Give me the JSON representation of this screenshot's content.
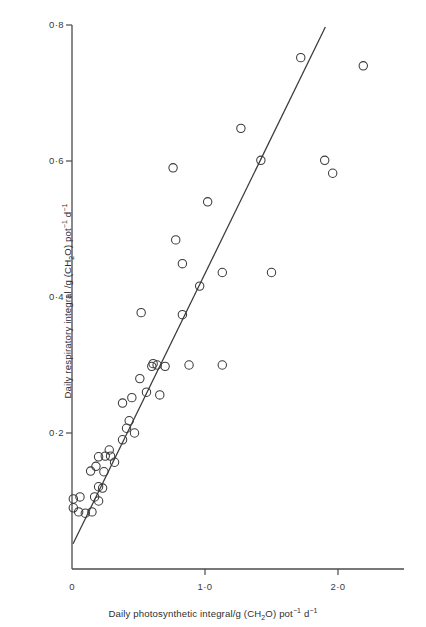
{
  "figure": {
    "background_color": "#ffffff",
    "ink_color": "#3a3a3c",
    "marker_shape": "open-circle",
    "marker_radius_px": 4.2
  },
  "axes": {
    "x": {
      "title_parts": {
        "pre": "Daily photosynthetic integral/g (CH",
        "sub1": "2",
        "mid": "O) pot",
        "sup1": "−1",
        "mid2": " d",
        "sup2": "−1"
      },
      "title_plain": "Daily photosynthetic integral/g (CH2O) pot-1 d-1",
      "ticks": [
        {
          "label": "0",
          "value": 0
        },
        {
          "label": "1·0",
          "value": 1.0
        },
        {
          "label": "2·0",
          "value": 2.0
        }
      ],
      "range": [
        0,
        2.33
      ]
    },
    "y": {
      "title_parts": {
        "pre": "Daily respiratory integral /g (CH",
        "sub1": "2",
        "mid": "O) pot",
        "sup1": "−1",
        "mid2": " d",
        "sup2": "−1"
      },
      "title_plain": "Daily respiratory integral /g (CH2O) pot-1 d-1",
      "ticks": [
        {
          "label": "0·2",
          "value": 0.2
        },
        {
          "label": "0·4",
          "value": 0.4
        },
        {
          "label": "0·6",
          "value": 0.6
        },
        {
          "label": "0·8",
          "value": 0.8
        }
      ],
      "range": [
        0,
        0.8
      ]
    }
  },
  "chart_data": {
    "type": "scatter",
    "title": "",
    "xlabel": "Daily photosynthetic integral/g (CH2O) pot-1 d-1",
    "ylabel": "Daily respiratory integral /g (CH2O) pot-1 d-1",
    "xlim": [
      0,
      2.33
    ],
    "ylim": [
      0,
      0.8
    ],
    "xticks": [
      0,
      1.0,
      2.0
    ],
    "xticklabels": [
      "0",
      "1·0",
      "2·0"
    ],
    "yticks": [
      0.2,
      0.4,
      0.6,
      0.8
    ],
    "yticklabels": [
      "0·2",
      "0·4",
      "0·6",
      "0·8"
    ],
    "grid": false,
    "legend": false,
    "series": [
      {
        "name": "observations",
        "marker": "open-circle",
        "points": [
          [
            0.01,
            0.103
          ],
          [
            0.06,
            0.106
          ],
          [
            0.17,
            0.106
          ],
          [
            0.2,
            0.1
          ],
          [
            0.01,
            0.09
          ],
          [
            0.05,
            0.084
          ],
          [
            0.1,
            0.082
          ],
          [
            0.15,
            0.084
          ],
          [
            0.2,
            0.121
          ],
          [
            0.23,
            0.119
          ],
          [
            0.14,
            0.144
          ],
          [
            0.18,
            0.151
          ],
          [
            0.2,
            0.165
          ],
          [
            0.25,
            0.166
          ],
          [
            0.29,
            0.166
          ],
          [
            0.24,
            0.143
          ],
          [
            0.28,
            0.175
          ],
          [
            0.32,
            0.157
          ],
          [
            0.38,
            0.19
          ],
          [
            0.41,
            0.207
          ],
          [
            0.47,
            0.2
          ],
          [
            0.43,
            0.218
          ],
          [
            0.38,
            0.244
          ],
          [
            0.45,
            0.252
          ],
          [
            0.51,
            0.28
          ],
          [
            0.56,
            0.26
          ],
          [
            0.6,
            0.298
          ],
          [
            0.64,
            0.3
          ],
          [
            0.66,
            0.256
          ],
          [
            0.61,
            0.302
          ],
          [
            0.83,
            0.374
          ],
          [
            0.52,
            0.377
          ],
          [
            0.7,
            0.298
          ],
          [
            0.88,
            0.3
          ],
          [
            0.78,
            0.484
          ],
          [
            0.83,
            0.449
          ],
          [
            0.76,
            0.59
          ],
          [
            0.96,
            0.416
          ],
          [
            1.02,
            0.54
          ],
          [
            1.13,
            0.3
          ],
          [
            1.13,
            0.436
          ],
          [
            1.27,
            0.648
          ],
          [
            1.42,
            0.601
          ],
          [
            1.5,
            0.436
          ],
          [
            1.9,
            0.601
          ],
          [
            1.96,
            0.582
          ],
          [
            1.72,
            0.752
          ],
          [
            2.19,
            0.74
          ]
        ]
      }
    ],
    "fit_line": {
      "name": "fitted regression line",
      "x_start": 0.008,
      "y_start": 0.037,
      "x_end": 1.905,
      "y_end": 0.797
    }
  }
}
